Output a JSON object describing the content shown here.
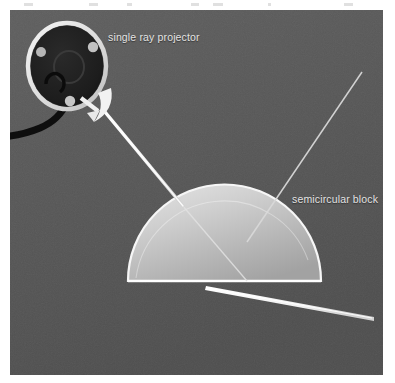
{
  "figure": {
    "domain": "photograph-optics-experiment",
    "canvas": {
      "width": 395,
      "height": 383,
      "background_color": "#ffffff"
    },
    "photo": {
      "x": 10,
      "y": 10,
      "width": 373,
      "height": 365,
      "background_color": "#575757",
      "background_color_alt": "#5e5e5e",
      "description": "Dark gray matte surface with a single ray projector and a semicircular acrylic block"
    },
    "labels": [
      {
        "id": "label-projector",
        "text": "single ray projector",
        "color": "#e3e3e3",
        "x": 108,
        "y": 31
      },
      {
        "id": "label-block",
        "text": "semicircular block",
        "color": "#e3e3e3",
        "x": 292,
        "y": 193
      }
    ],
    "objects": {
      "projector": {
        "name": "single ray projector",
        "center_x": 67,
        "center_y": 66,
        "radius_x": 39,
        "radius_y": 43,
        "body_color": "#1f1f1f",
        "rim_color": "#e8e8e8",
        "screws": 3,
        "screw_color": "#b9b9b9",
        "has_center_dial": true,
        "cable_color": "#0d0d0d"
      },
      "semicircular_block": {
        "name": "semicircular block",
        "base_left_x": 128,
        "base_right_x": 321,
        "base_y": 281,
        "apex_y": 188,
        "fill_light": "#d3d3d3",
        "fill_dark": "#a8a8a8",
        "edge_color": "#f2f2f2",
        "orientation": "flat side down"
      },
      "rotation_arrow": {
        "name": "rotation arrow",
        "color": "#f0f0f0",
        "description": "curved white arrow on lower-right of projector indicating rotation"
      }
    },
    "rays": [
      {
        "id": "incident-ray",
        "name": "incident ray",
        "x1": 105,
        "y1": 112,
        "x2": 182,
        "y2": 205,
        "color": "#f5f5f5",
        "width": 3.2
      },
      {
        "id": "internal-ray",
        "name": "ray inside block",
        "x1": 182,
        "y1": 205,
        "x2": 247,
        "y2": 281,
        "color": "#e8e8e8",
        "width": 1.3
      },
      {
        "id": "reflected-ray",
        "name": "partially reflected ray",
        "x1": 247,
        "y1": 242,
        "x2": 362,
        "y2": 72,
        "color": "#d8d8d8",
        "width": 1.4
      },
      {
        "id": "refracted-ray",
        "name": "refracted emergent ray",
        "x1": 206,
        "y1": 286,
        "x2": 372,
        "y2": 315,
        "color": "#fafafa",
        "width": 3.0
      }
    ],
    "top_artifacts": [
      {
        "x": 24,
        "width": 9
      },
      {
        "x": 89,
        "width": 9
      },
      {
        "x": 127,
        "width": 5
      },
      {
        "x": 191,
        "width": 8
      },
      {
        "x": 213,
        "width": 10
      },
      {
        "x": 268,
        "width": 3
      },
      {
        "x": 344,
        "width": 9
      }
    ]
  }
}
